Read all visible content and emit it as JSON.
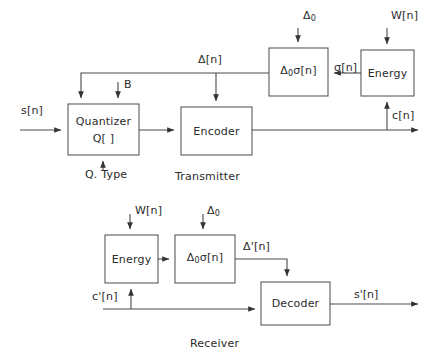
{
  "diagram": {
    "title_transmitter": "Transmitter",
    "title_receiver": "Receiver",
    "transmitter": {
      "boxes": {
        "quantizer_line1": "Quantizer",
        "quantizer_line2": "Q[  ]",
        "encoder": "Encoder",
        "delta_sigma": "Δ",
        "delta_sigma_sub": "0",
        "delta_sigma_tail": "σ[n]",
        "energy": "Energy"
      },
      "signals": {
        "input_s": "s[n]",
        "bits_b": "B",
        "q_type": "Q. Type",
        "delta_n": "Δ[n]",
        "sigma_n": "σ[n]",
        "delta_zero": "Δ",
        "delta_zero_sub": "0",
        "w_n": "W[n]",
        "c_n": "c[n]"
      }
    },
    "receiver": {
      "boxes": {
        "energy": "Energy",
        "delta_sigma": "Δ",
        "delta_sigma_sub": "0",
        "delta_sigma_tail": "σ[n]",
        "decoder": "Decoder"
      },
      "signals": {
        "w_n": "W[n]",
        "delta_zero": "Δ",
        "delta_zero_sub": "0",
        "delta_prime_n": "Δ'[n]",
        "c_prime_n": "c'[n]",
        "s_hat_prime_n": "s'[n]",
        "s_hat_mark": "^"
      }
    },
    "colors": {
      "line": "#4a4a4a",
      "box_border": "#5a5a5a",
      "text": "#2b2b2b",
      "background": "#ffffff"
    }
  }
}
